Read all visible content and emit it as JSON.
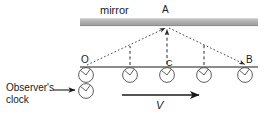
{
  "figure": {
    "title_label": "mirror",
    "labels": {
      "mirror": "mirror",
      "point_a": "A",
      "point_o": "O",
      "point_c": "C",
      "point_b": "B",
      "velocity": "V",
      "observer_clock_line1": "Observer's",
      "observer_clock_line2": "clock"
    },
    "colors": {
      "mirror_fill": "#b3b3b3",
      "mirror_edge": "#8c8c8c",
      "line": "#1a1a1a",
      "dashed": "#333333",
      "clock_stroke": "#4d4d4d",
      "text": "#1a1a1a",
      "background": "#ffffff"
    },
    "geometry": {
      "mirror": {
        "x": 80,
        "y": 18,
        "width": 178,
        "height": 8
      },
      "baseline": {
        "x1": 80,
        "y1": 67,
        "x2": 258,
        "y2": 67
      },
      "point_a": {
        "x": 167,
        "y": 26
      },
      "point_o": {
        "x": 86,
        "y": 67
      },
      "point_b": {
        "x": 246,
        "y": 67
      },
      "point_c": {
        "x": 167,
        "y": 67
      },
      "clock_radius": 7.5,
      "clock_positions_x": [
        86,
        130,
        167,
        204,
        245
      ],
      "clock_baseline_y": 75,
      "observer_clock": {
        "x": 86,
        "y": 92
      },
      "dashed_verticals_x": [
        130,
        204
      ],
      "velocity_arrow": {
        "x1": 122,
        "y1": 95,
        "x2": 201,
        "y2": 95
      },
      "observer_arrow": {
        "x1": 53,
        "y1": 90,
        "x2": 75,
        "y2": 90
      }
    },
    "clock_hands": {
      "hour_angle_deg": -140,
      "minute_angle_deg": -35
    }
  }
}
